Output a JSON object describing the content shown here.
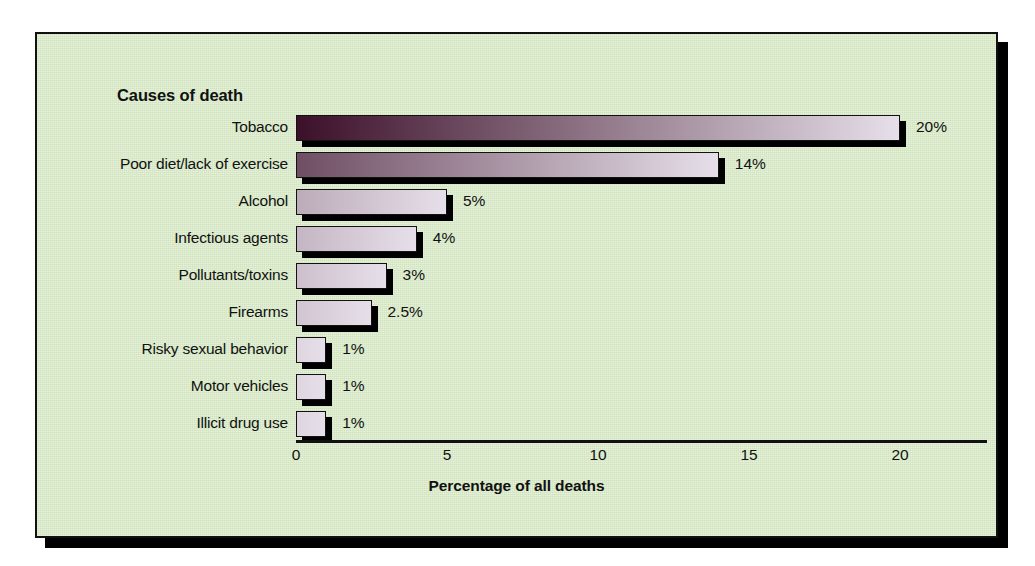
{
  "chart_data": {
    "type": "bar",
    "orientation": "horizontal",
    "title": "Causes of death",
    "xlabel": "Percentage of all deaths",
    "ylabel": "",
    "xlim": [
      0,
      23
    ],
    "xticks": [
      0,
      5,
      10,
      15,
      20
    ],
    "xtick_labels": [
      "0",
      "5",
      "10",
      "15",
      "20"
    ],
    "grid": false,
    "legend": "none",
    "categories": [
      "Tobacco",
      "Poor diet/lack of exercise",
      "Alcohol",
      "Infectious agents",
      "Pollutants/toxins",
      "Firearms",
      "Risky sexual behavior",
      "Motor vehicles",
      "Illicit drug use"
    ],
    "values": [
      20,
      14,
      5,
      4,
      3,
      2.5,
      1,
      1,
      1
    ],
    "value_labels": [
      "20%",
      "14%",
      "5%",
      "4%",
      "3%",
      "2.5%",
      "1%",
      "1%",
      "1%"
    ],
    "bar_gradient_start": "#3c1029",
    "bar_gradient_end": "#e6dfe9",
    "panel_background": "#cfe4bb",
    "text_color": "#111111"
  },
  "figure": {
    "title": "Causes of death",
    "axis_title": "Percentage of all deaths"
  }
}
